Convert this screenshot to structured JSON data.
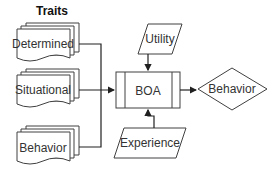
{
  "diagram": {
    "group_title": "Traits",
    "traits": [
      {
        "label": "Determined"
      },
      {
        "label": "Situational"
      },
      {
        "label": "Behavior"
      }
    ],
    "process": {
      "label": "BOA"
    },
    "inputs": {
      "top": {
        "label": "Utility"
      },
      "bottom": {
        "label": "Experience"
      }
    },
    "output": {
      "label": "Behavior"
    },
    "colors": {
      "stroke": "#404040",
      "line": "#202020",
      "fill": "#ffffff",
      "text": "#333333"
    }
  }
}
